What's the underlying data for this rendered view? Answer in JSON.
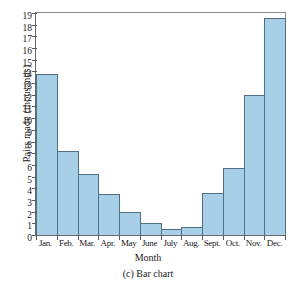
{
  "chart_data": {
    "type": "bar",
    "title": "",
    "caption": "(c) Bar chart",
    "xlabel": "Month",
    "ylabel": "Pairs made (thousands)",
    "categories": [
      "Jan.",
      "Feb.",
      "Mar.",
      "Apr.",
      "May",
      "June",
      "July",
      "Aug.",
      "Sept.",
      "Oct.",
      "Nov.",
      "Dec."
    ],
    "values": [
      13.8,
      7.2,
      5.2,
      3.5,
      2.0,
      1.0,
      0.5,
      0.7,
      3.6,
      5.7,
      12.0,
      18.6
    ],
    "ylim": [
      0,
      19
    ],
    "ytick_labels": [
      "0",
      "1",
      "2",
      "3",
      "4",
      "5",
      "6",
      "7",
      "8",
      "9",
      "10",
      "11",
      "12",
      "13",
      "14",
      "15",
      "16",
      "17",
      "18",
      "19"
    ],
    "ytick_step": 1,
    "grid": false,
    "legend": null,
    "bar_fill_color": "#a8cfe8",
    "bar_edge_color": "#4f6f84",
    "axis_color": "#5c5c5c",
    "background_color": "#ffffff"
  }
}
